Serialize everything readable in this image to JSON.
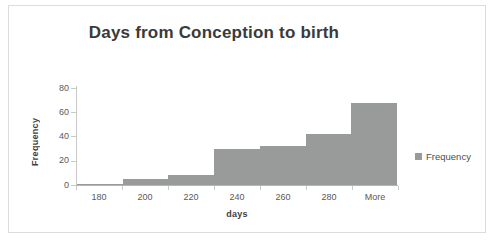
{
  "chart_data": {
    "type": "bar",
    "title": "Days from Conception to birth",
    "xlabel": "days",
    "ylabel": "Frequency",
    "categories": [
      "180",
      "200",
      "220",
      "240",
      "260",
      "280",
      "More"
    ],
    "values": [
      0,
      5,
      8,
      30,
      32,
      42,
      68
    ],
    "series": [
      {
        "name": "Frequency",
        "values": [
          0,
          5,
          8,
          30,
          32,
          42,
          68
        ]
      }
    ],
    "ylim": [
      0,
      80
    ],
    "yticks": [
      0,
      20,
      40,
      60,
      80
    ],
    "xticks": [
      "180",
      "200",
      "220",
      "240",
      "260",
      "280",
      "More"
    ],
    "grid": false,
    "legend": {
      "position": "right",
      "entries": [
        "Frequency"
      ]
    },
    "bar_color": "#999a9a",
    "axis_color": "#c9c9c9",
    "text_color": "#595959",
    "title_color": "#3a3a3a",
    "border_color": "#dcdcdc"
  },
  "legend": {
    "label": "Frequency"
  }
}
